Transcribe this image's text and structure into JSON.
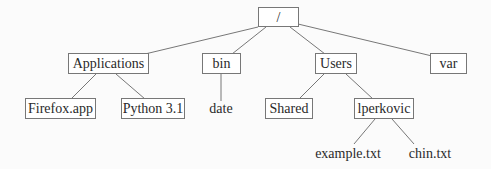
{
  "diagram": {
    "type": "directory-tree",
    "line_color": "#777777",
    "box_border_color": "#777777",
    "nodes": {
      "root": {
        "label": "/",
        "kind": "folder"
      },
      "applications": {
        "label": "Applications",
        "kind": "folder"
      },
      "bin": {
        "label": "bin",
        "kind": "folder"
      },
      "users": {
        "label": "Users",
        "kind": "folder"
      },
      "var": {
        "label": "var",
        "kind": "folder"
      },
      "firefox": {
        "label": "Firefox.app",
        "kind": "folder"
      },
      "python": {
        "label": "Python 3.1",
        "kind": "folder"
      },
      "date": {
        "label": "date",
        "kind": "file"
      },
      "shared": {
        "label": "Shared",
        "kind": "folder"
      },
      "lperkovic": {
        "label": "lperkovic",
        "kind": "folder"
      },
      "example": {
        "label": "example.txt",
        "kind": "file"
      },
      "chin": {
        "label": "chin.txt",
        "kind": "file"
      }
    },
    "edges": [
      [
        "root",
        "applications"
      ],
      [
        "root",
        "bin"
      ],
      [
        "root",
        "users"
      ],
      [
        "root",
        "var"
      ],
      [
        "applications",
        "firefox"
      ],
      [
        "applications",
        "python"
      ],
      [
        "bin",
        "date"
      ],
      [
        "users",
        "shared"
      ],
      [
        "users",
        "lperkovic"
      ],
      [
        "lperkovic",
        "example"
      ],
      [
        "lperkovic",
        "chin"
      ]
    ]
  }
}
